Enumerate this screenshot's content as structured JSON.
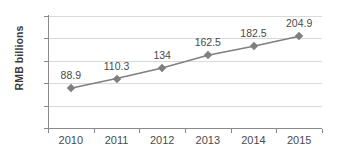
{
  "chart_data": {
    "type": "line",
    "title": "",
    "xlabel": "",
    "ylabel": "RMB billions",
    "categories": [
      "2010",
      "2011",
      "2012",
      "2013",
      "2014",
      "2015"
    ],
    "values": [
      88.9,
      110.3,
      134,
      162.5,
      182.5,
      204.9
    ],
    "point_labels": [
      "88.9",
      "110.3",
      "134",
      "162.5",
      "182.5",
      "204.9"
    ],
    "ylim": [
      0,
      250
    ],
    "yticks": [
      0,
      50,
      100,
      150,
      200,
      250
    ],
    "ytick_labels": [
      "0",
      "50",
      "100",
      "150",
      "200",
      "250"
    ],
    "grid": true,
    "legend": "none",
    "series": [
      {
        "name": "RMB billions",
        "values": [
          88.9,
          110.3,
          134,
          162.5,
          182.5,
          204.9
        ],
        "color": "#7f7f7f",
        "marker": "diamond"
      }
    ],
    "colors": {
      "line": "#7f7f7f",
      "marker": "#7f7f7f",
      "gridline": "#d9d9d9",
      "axis": "#8a8a8a",
      "text": "#4a4a4a",
      "axis_title": "#3a3a3a",
      "background": "#ffffff"
    }
  }
}
